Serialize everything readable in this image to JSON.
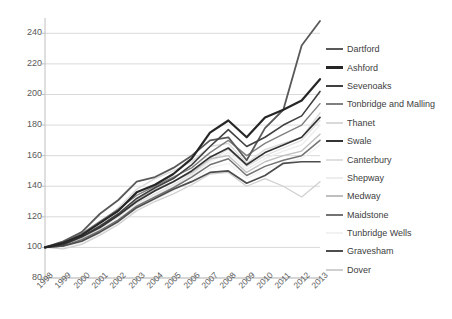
{
  "chart_data": {
    "type": "line",
    "title": "",
    "xlabel": "",
    "ylabel": "",
    "grid": true,
    "legend_position": "right",
    "ylim": [
      80,
      250
    ],
    "yticks": [
      80,
      100,
      120,
      140,
      160,
      180,
      200,
      220,
      240
    ],
    "categories": [
      "1998",
      "1999",
      "2000",
      "2001",
      "2002",
      "2003",
      "2004",
      "2005",
      "2006",
      "2007",
      "2008",
      "2009",
      "2010",
      "2011",
      "2012",
      "2013"
    ],
    "x": [
      1998,
      1999,
      2000,
      2001,
      2002,
      2003,
      2004,
      2005,
      2006,
      2007,
      2008,
      2009,
      2010,
      2011,
      2012,
      2013
    ],
    "series": [
      {
        "name": "Dartford",
        "color": "#595959",
        "width": 1.8,
        "values": [
          100,
          104,
          110,
          122,
          131,
          143,
          146,
          152,
          160,
          170,
          172,
          157,
          178,
          190,
          232,
          248
        ]
      },
      {
        "name": "Ashford",
        "color": "#262626",
        "width": 2.2,
        "values": [
          100,
          103,
          108,
          116,
          124,
          136,
          141,
          148,
          158,
          175,
          183,
          172,
          185,
          190,
          196,
          210
        ]
      },
      {
        "name": "Sevenoaks",
        "color": "#404040",
        "width": 1.6,
        "values": [
          100,
          102,
          107,
          114,
          122,
          132,
          139,
          145,
          154,
          166,
          177,
          166,
          172,
          180,
          186,
          202
        ]
      },
      {
        "name": "Tonbridge and Malling",
        "color": "#808080",
        "width": 1.4,
        "values": [
          100,
          103,
          109,
          117,
          125,
          134,
          140,
          146,
          152,
          162,
          170,
          160,
          168,
          174,
          180,
          194
        ]
      },
      {
        "name": "Thanet",
        "color": "#d9d9d9",
        "width": 1.3,
        "values": [
          100,
          101,
          106,
          115,
          126,
          138,
          145,
          150,
          156,
          166,
          168,
          155,
          164,
          168,
          172,
          188
        ]
      },
      {
        "name": "Swale",
        "color": "#333333",
        "width": 1.7,
        "values": [
          100,
          102,
          107,
          113,
          121,
          130,
          137,
          143,
          150,
          159,
          165,
          154,
          162,
          167,
          172,
          185
        ]
      },
      {
        "name": "Canterbury",
        "color": "#e0e0e0",
        "width": 1.3,
        "values": [
          100,
          101,
          105,
          112,
          120,
          129,
          135,
          141,
          148,
          157,
          164,
          153,
          160,
          165,
          170,
          183
        ]
      },
      {
        "name": "Shepway",
        "color": "#ededed",
        "width": 1.3,
        "values": [
          100,
          100,
          104,
          110,
          118,
          128,
          134,
          140,
          147,
          156,
          162,
          151,
          158,
          163,
          167,
          180
        ]
      },
      {
        "name": "Medway",
        "color": "#bfbfbf",
        "width": 1.4,
        "values": [
          100,
          102,
          106,
          113,
          121,
          131,
          138,
          143,
          149,
          158,
          160,
          149,
          156,
          160,
          163,
          174
        ]
      },
      {
        "name": "Maidstone",
        "color": "#737373",
        "width": 1.5,
        "values": [
          100,
          101,
          105,
          111,
          118,
          127,
          133,
          139,
          146,
          154,
          158,
          147,
          153,
          157,
          160,
          170
        ]
      },
      {
        "name": "Tunbridge Wells",
        "color": "#f2f2f2",
        "width": 1.3,
        "values": [
          100,
          100,
          103,
          109,
          116,
          125,
          131,
          137,
          144,
          152,
          155,
          145,
          151,
          155,
          158,
          167
        ]
      },
      {
        "name": "Gravesham",
        "color": "#4d4d4d",
        "width": 1.7,
        "values": [
          100,
          101,
          104,
          110,
          117,
          126,
          132,
          138,
          143,
          149,
          150,
          142,
          147,
          155,
          156,
          156
        ]
      },
      {
        "name": "Dover",
        "color": "#d0d0d0",
        "width": 1.3,
        "values": [
          100,
          99,
          102,
          108,
          115,
          124,
          130,
          135,
          141,
          148,
          149,
          140,
          145,
          140,
          133,
          143
        ]
      }
    ]
  },
  "legend": {
    "items": [
      {
        "label": "Dartford"
      },
      {
        "label": "Ashford"
      },
      {
        "label": "Sevenoaks"
      },
      {
        "label": "Tonbridge and Malling"
      },
      {
        "label": "Thanet"
      },
      {
        "label": "Swale"
      },
      {
        "label": "Canterbury"
      },
      {
        "label": "Shepway"
      },
      {
        "label": "Medway"
      },
      {
        "label": "Maidstone"
      },
      {
        "label": "Tunbridge Wells"
      },
      {
        "label": "Gravesham"
      },
      {
        "label": "Dover"
      }
    ]
  },
  "axes": {
    "gridline_color": "#d9d9d9",
    "axis_color": "#bfbfbf",
    "tick_label_color": "#595959"
  }
}
